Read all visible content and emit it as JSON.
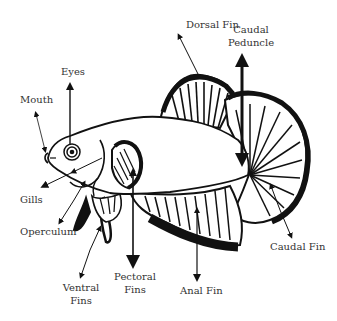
{
  "diagram": {
    "colors": {
      "ink": "#111111",
      "label": "#333333",
      "background": "#ffffff"
    },
    "labels": {
      "dorsal_fin": "Dorsal Fin",
      "caudal_peduncle_line1": "Caudal",
      "caudal_peduncle_line2": "Peduncle",
      "eyes": "Eyes",
      "mouth": "Mouth",
      "gills": "Gills",
      "operculum": "Operculum",
      "ventral_fins_line1": "Ventral",
      "ventral_fins_line2": "Fins",
      "pectoral_fins_line1": "Pectoral",
      "pectoral_fins_line2": "Fins",
      "anal_fin": "Anal Fin",
      "caudal_fin": "Caudal Fin"
    }
  }
}
